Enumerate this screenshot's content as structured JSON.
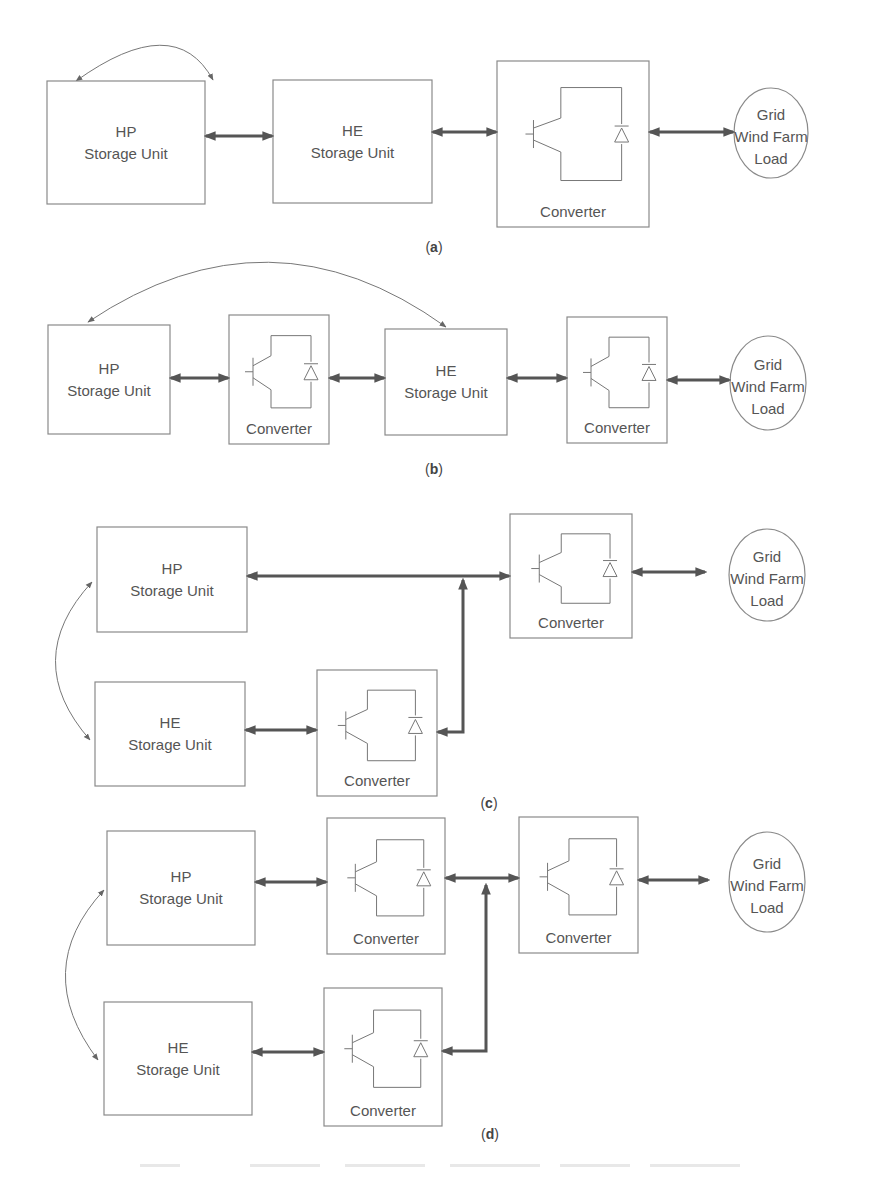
{
  "figure": {
    "panels": [
      {
        "id": "a",
        "caption": "a",
        "caption_pos": [
          434,
          252
        ],
        "blocks": [
          {
            "type": "storage",
            "x": 47,
            "y": 81,
            "w": 158,
            "h": 123,
            "lines": [
              "HP",
              "Storage Unit"
            ]
          },
          {
            "type": "storage",
            "x": 273,
            "y": 80,
            "w": 159,
            "h": 123,
            "lines": [
              "HE",
              "Storage Unit"
            ]
          },
          {
            "type": "converter",
            "x": 497,
            "y": 61,
            "w": 152,
            "h": 166,
            "label": "Converter"
          },
          {
            "type": "load",
            "cx": 771,
            "cy": 133,
            "rx": 37,
            "ry": 45,
            "lines": [
              "Grid",
              "Wind Farm",
              "Load"
            ]
          }
        ],
        "links": [
          {
            "kind": "bidir",
            "points": [
              [
                206,
                136
              ],
              [
                272,
                136
              ]
            ]
          },
          {
            "kind": "bidir",
            "points": [
              [
                433,
                132
              ],
              [
                496,
                132
              ]
            ]
          },
          {
            "kind": "bidir",
            "points": [
              [
                650,
                132
              ],
              [
                733,
                132
              ]
            ]
          }
        ],
        "curves": [
          {
            "d": "M76 81 Q175 10 213 80"
          }
        ]
      },
      {
        "id": "b",
        "caption": "b",
        "caption_pos": [
          434,
          474
        ],
        "blocks": [
          {
            "type": "storage",
            "x": 48,
            "y": 325,
            "w": 122,
            "h": 109,
            "lines": [
              "HP",
              "Storage Unit"
            ]
          },
          {
            "type": "converter",
            "x": 229,
            "y": 315,
            "w": 100,
            "h": 129,
            "label": "Converter"
          },
          {
            "type": "storage",
            "x": 385,
            "y": 329,
            "w": 122,
            "h": 106,
            "lines": [
              "HE",
              "Storage Unit"
            ]
          },
          {
            "type": "converter",
            "x": 567,
            "y": 317,
            "w": 100,
            "h": 126,
            "label": "Converter"
          },
          {
            "type": "load",
            "cx": 768,
            "cy": 383,
            "rx": 38,
            "ry": 47,
            "lines": [
              "Grid",
              "Wind Farm",
              "Load"
            ]
          }
        ],
        "links": [
          {
            "kind": "bidir",
            "points": [
              [
                171,
                378
              ],
              [
                228,
                378
              ]
            ]
          },
          {
            "kind": "bidir",
            "points": [
              [
                330,
                378
              ],
              [
                384,
                378
              ]
            ]
          },
          {
            "kind": "bidir",
            "points": [
              [
                508,
                378
              ],
              [
                566,
                378
              ]
            ]
          },
          {
            "kind": "bidir",
            "points": [
              [
                668,
                380
              ],
              [
                729,
                380
              ]
            ]
          }
        ],
        "curves": [
          {
            "d": "M88 322 Q270 200 446 327"
          }
        ]
      },
      {
        "id": "c",
        "caption": "c",
        "caption_pos": [
          489,
          808
        ],
        "blocks": [
          {
            "type": "storage",
            "x": 97,
            "y": 527,
            "w": 150,
            "h": 105,
            "lines": [
              "HP",
              "Storage Unit"
            ]
          },
          {
            "type": "converter",
            "x": 510,
            "y": 514,
            "w": 122,
            "h": 124,
            "label": "Converter"
          },
          {
            "type": "load",
            "cx": 767,
            "cy": 575,
            "rx": 38,
            "ry": 46,
            "lines": [
              "Grid",
              "Wind Farm",
              "Load"
            ]
          },
          {
            "type": "storage",
            "x": 95,
            "y": 682,
            "w": 150,
            "h": 104,
            "lines": [
              "HE",
              "Storage Unit"
            ]
          },
          {
            "type": "converter",
            "x": 317,
            "y": 670,
            "w": 120,
            "h": 126,
            "label": "Converter"
          }
        ],
        "links": [
          {
            "kind": "bidir",
            "points": [
              [
                248,
                576
              ],
              [
                509,
                576
              ]
            ]
          },
          {
            "kind": "bidir",
            "points": [
              [
                633,
                572
              ],
              [
                705,
                572
              ]
            ]
          },
          {
            "kind": "bidir",
            "points": [
              [
                246,
                730
              ],
              [
                316,
                730
              ]
            ]
          },
          {
            "kind": "tee",
            "points": [
              [
                438,
                732
              ],
              [
                463,
                732
              ],
              [
                463,
                580
              ]
            ]
          }
        ],
        "curves": [
          {
            "d": "M92 582 Q20 660 90 740"
          }
        ]
      },
      {
        "id": "d",
        "caption": "d",
        "caption_pos": [
          490,
          1139
        ],
        "blocks": [
          {
            "type": "storage",
            "x": 107,
            "y": 831,
            "w": 148,
            "h": 114,
            "lines": [
              "HP",
              "Storage Unit"
            ]
          },
          {
            "type": "converter",
            "x": 327,
            "y": 818,
            "w": 118,
            "h": 136,
            "label": "Converter"
          },
          {
            "type": "converter",
            "x": 519,
            "y": 817,
            "w": 119,
            "h": 136,
            "label": "Converter"
          },
          {
            "type": "load",
            "cx": 767,
            "cy": 882,
            "rx": 38,
            "ry": 50,
            "lines": [
              "Grid",
              "Wind Farm",
              "Load"
            ]
          },
          {
            "type": "storage",
            "x": 104,
            "y": 1002,
            "w": 148,
            "h": 113,
            "lines": [
              "HE",
              "Storage Unit"
            ]
          },
          {
            "type": "converter",
            "x": 324,
            "y": 988,
            "w": 118,
            "h": 138,
            "label": "Converter"
          }
        ],
        "links": [
          {
            "kind": "bidir",
            "points": [
              [
                256,
                882
              ],
              [
                326,
                882
              ]
            ]
          },
          {
            "kind": "bidir",
            "points": [
              [
                446,
                878
              ],
              [
                518,
                878
              ]
            ]
          },
          {
            "kind": "bidir",
            "points": [
              [
                639,
                880
              ],
              [
                708,
                880
              ]
            ]
          },
          {
            "kind": "bidir",
            "points": [
              [
                253,
                1052
              ],
              [
                323,
                1052
              ]
            ]
          },
          {
            "kind": "tee",
            "points": [
              [
                443,
                1051
              ],
              [
                486,
                1051
              ],
              [
                486,
                885
              ]
            ]
          }
        ],
        "curves": [
          {
            "d": "M104 890 Q30 970 98 1060"
          }
        ]
      }
    ]
  },
  "colors": {
    "stroke": "#8a8a8a",
    "arrow": "#555555",
    "text": "#555555"
  }
}
